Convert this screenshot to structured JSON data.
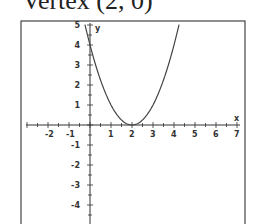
{
  "title": "Vertex (2, 0)",
  "chart_data": {
    "type": "line",
    "title": "Vertex (2, 0)",
    "xlabel": "x",
    "ylabel": "y",
    "xlim": [
      -3,
      7
    ],
    "ylim": [
      -5,
      5
    ],
    "x_ticks": [
      -2,
      -1,
      1,
      2,
      3,
      4,
      5,
      6,
      7
    ],
    "y_ticks": [
      5,
      4,
      3,
      2,
      1,
      -1,
      -2,
      -3,
      -4
    ],
    "grid": false,
    "series": [
      {
        "name": "y = (x - 2)^2",
        "x": [
          -0.24,
          0,
          1,
          2,
          3,
          4,
          4.24
        ],
        "values": [
          5,
          4,
          1,
          0,
          1,
          4,
          5
        ]
      }
    ],
    "annotations": [
      "Vertex (2, 0)"
    ]
  },
  "axis_labels": {
    "x": "x",
    "y": "y"
  },
  "x_tick_labels": [
    "-2",
    "-1",
    "1",
    "2",
    "3",
    "4",
    "5",
    "6",
    "7"
  ],
  "y_tick_labels": [
    "5",
    "4",
    "3",
    "2",
    "1",
    "-1",
    "-2",
    "-3",
    "-4"
  ]
}
